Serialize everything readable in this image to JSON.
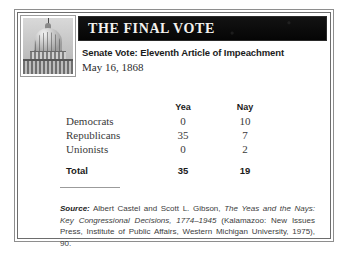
{
  "card": {
    "masthead_icon": "capitol-dome-icon",
    "title": "THE FINAL VOTE",
    "subtitle": "Senate Vote: Eleventh Article of Impeachment",
    "date": "May 16, 1868"
  },
  "table": {
    "headers": [
      "",
      "Yea",
      "Nay"
    ],
    "rows": [
      {
        "party": "Democrats",
        "yea": "0",
        "nay": "10"
      },
      {
        "party": "Republicans",
        "yea": "35",
        "nay": "7"
      },
      {
        "party": "Unionists",
        "yea": "0",
        "nay": "2"
      }
    ],
    "total": {
      "party": "Total",
      "yea": "35",
      "nay": "19"
    }
  },
  "source": {
    "label": "Source:",
    "authors": " Albert Castel and Scott L. Gibson, ",
    "title": "The Yeas and the Nays: Key Congressional Decisions, 1774–1945",
    "publication": " (Kalamazoo: New Issues Press, Institute of Public Affairs, Western Michigan University, 1975), 90."
  },
  "colors": {
    "band_background": "#0a0a0a",
    "band_text": "#f4f2ee",
    "frame_outer": "#8e8e8e",
    "frame_inner": "#6d6d6d",
    "body_text": "#3a3a3a",
    "emphasis_text": "#1b1b1b"
  }
}
